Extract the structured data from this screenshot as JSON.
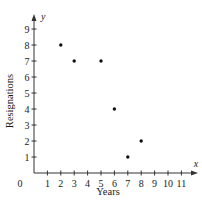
{
  "chart_data": {
    "type": "scatter",
    "title": "",
    "xlabel": "Years",
    "ylabel": "Resignations",
    "x_axis_letter": "x",
    "y_axis_letter": "y",
    "origin_label": "0",
    "x_ticks": [
      1,
      2,
      3,
      4,
      5,
      6,
      7,
      8,
      9,
      10,
      11
    ],
    "y_ticks": [
      1,
      2,
      3,
      4,
      5,
      6,
      7,
      8,
      9
    ],
    "xlim": [
      0,
      12
    ],
    "ylim": [
      0,
      10
    ],
    "grid": false,
    "legend": null,
    "points": [
      {
        "x": 2,
        "y": 8
      },
      {
        "x": 3,
        "y": 7
      },
      {
        "x": 5,
        "y": 7
      },
      {
        "x": 6,
        "y": 4
      },
      {
        "x": 7,
        "y": 1
      },
      {
        "x": 8,
        "y": 2
      }
    ],
    "x": [
      2,
      3,
      5,
      6,
      7,
      8
    ],
    "y": [
      8,
      7,
      7,
      4,
      1,
      2
    ],
    "colors": {
      "axis": "#333333",
      "point": "#111111",
      "text": "#1a1a1a"
    }
  }
}
